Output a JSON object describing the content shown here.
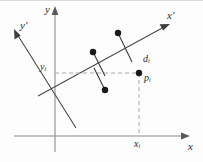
{
  "figure": {
    "type": "diagram",
    "canvas": {
      "width": 203,
      "height": 162,
      "background": "#fdfdfd"
    },
    "colors": {
      "axis": "#8c8c8c",
      "principal_axis": "#4a4a4a",
      "dashed_guide": "#a8a8a8",
      "data_point": "#1a1a1a",
      "label_text": "#2b2b2b",
      "frame": "#d9d9d9"
    },
    "axes": [
      {
        "name": "y-axis",
        "label": "y",
        "label_x": 45,
        "label_y": 5,
        "orientation": "vertical",
        "x": 55,
        "from_y": 152,
        "to_y": 10
      },
      {
        "name": "x-axis",
        "label": "x",
        "label_x": 188,
        "label_y": 142,
        "orientation": "horizontal",
        "y": 136,
        "from_x": 14,
        "to_x": 188
      },
      {
        "name": "x-prime-axis",
        "label": "x'",
        "label_x": 167,
        "label_y": 11,
        "orientation": "rotated",
        "from_x": 38,
        "from_y": 96,
        "to_x": 170,
        "to_y": 24
      },
      {
        "name": "y-prime-axis",
        "label": "y'",
        "label_x": 20,
        "label_y": 21,
        "orientation": "rotated",
        "from_x": 76,
        "from_y": 128,
        "to_x": 14,
        "to_y": 30
      }
    ],
    "labels": [
      {
        "name": "y-sub-i-label",
        "base": "y",
        "sub": "i",
        "x": 40,
        "y": 62
      },
      {
        "name": "x-sub-i-label",
        "base": "x",
        "sub": "i",
        "x": 134,
        "y": 139
      },
      {
        "name": "d-sub-i-label",
        "base": "d",
        "sub": "i",
        "x": 143,
        "y": 54
      },
      {
        "name": "p-sub-i-label",
        "base": "p",
        "sub": "i",
        "x": 144,
        "y": 73
      }
    ],
    "data_points": [
      {
        "name": "data-point-1",
        "x": 93,
        "y": 52,
        "foot_x": 105,
        "foot_y": 76
      },
      {
        "name": "data-point-2",
        "x": 118,
        "y": 33,
        "foot_x": 132,
        "foot_y": 62
      },
      {
        "name": "data-point-3",
        "x": 105,
        "y": 90,
        "foot_x": 94,
        "foot_y": 68
      },
      {
        "name": "projected-point-p-i",
        "x": 139,
        "y": 73,
        "foot_x": 139,
        "foot_y": 73
      }
    ],
    "guides": [
      {
        "name": "horizontal-dashed-guide",
        "from_x": 55,
        "from_y": 73,
        "to_x": 139,
        "to_y": 73
      },
      {
        "name": "vertical-dashed-guide",
        "from_x": 139,
        "from_y": 73,
        "to_x": 139,
        "to_y": 136
      }
    ]
  }
}
